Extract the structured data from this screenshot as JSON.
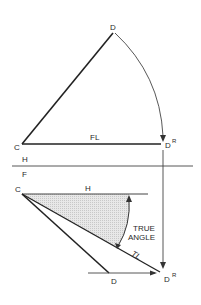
{
  "figure": {
    "top_view": {
      "point_D": "D",
      "point_C": "C",
      "point_DR": "D",
      "point_DR_sup": "R",
      "line_label": "FL"
    },
    "fold_line": {
      "upper": "H",
      "lower": "F"
    },
    "front_view": {
      "point_C": "C",
      "horizontal_label": "H",
      "point_D": "D",
      "point_DR": "D",
      "point_DR_sup": "R",
      "true_length_label": "TL",
      "angle_label_line1": "TRUE",
      "angle_label_line2": "ANGLE"
    },
    "colors": {
      "line": "#2a2a2a",
      "shade": "#d9d9d9",
      "background": "#ffffff"
    }
  }
}
